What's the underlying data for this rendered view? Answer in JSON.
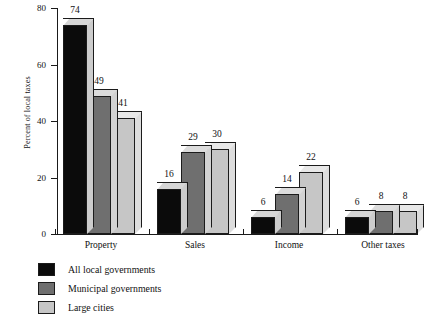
{
  "chart_data": {
    "type": "bar",
    "title": "",
    "subtitle": "",
    "xlabel": "",
    "ylabel": "Percent of local taxes",
    "ylim": [
      0,
      80
    ],
    "yticks": [
      0,
      20,
      40,
      60,
      80
    ],
    "ytick_labels": [
      "0",
      "20",
      "40",
      "60",
      "80"
    ],
    "grid": false,
    "legend_position": "bottom-left",
    "categories": [
      "Property",
      "Sales",
      "Income",
      "Other taxes"
    ],
    "series": [
      {
        "name": "All local governments",
        "color": "#0b0b0b",
        "top_color": "#d6d6d6",
        "side_color": "#cccccc",
        "values": [
          74,
          16,
          6,
          6
        ]
      },
      {
        "name": "Municipal governments",
        "color": "#6f6f6f",
        "top_color": "#dcdcdc",
        "side_color": "#d2d2d2",
        "values": [
          49,
          29,
          14,
          8
        ]
      },
      {
        "name": "Large cities",
        "color": "#c6c6c6",
        "top_color": "#e8e8e8",
        "side_color": "#dddddd",
        "values": [
          41,
          30,
          22,
          8
        ]
      }
    ],
    "data_labels": [
      [
        "74",
        "49",
        "41"
      ],
      [
        "16",
        "29",
        "30"
      ],
      [
        "6",
        "14",
        "22"
      ],
      [
        "6",
        "8",
        "8"
      ]
    ]
  },
  "legend": {
    "items": [
      {
        "label": "All local governments"
      },
      {
        "label": "Municipal governments"
      },
      {
        "label": "Large cities"
      }
    ]
  }
}
